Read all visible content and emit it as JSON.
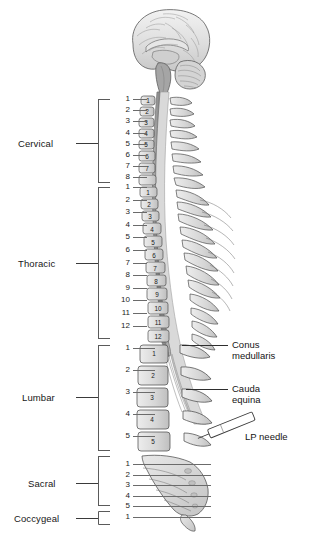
{
  "figure": {
    "background": "#ffffff"
  },
  "colors": {
    "bone_fill": "#dcdcdc",
    "bone_stroke": "#4d4d4d",
    "cord_dark": "#8c8c8c",
    "canal_light": "#c9c9c9",
    "brain_fill": "#e2e2e2",
    "brain_stroke": "#5a5a5a",
    "needle_fill": "#ffffff",
    "needle_stroke": "#3a3a3a",
    "text": "#171717",
    "leader_line": "#2e2e2e",
    "bracket_line": "#5a5a5a"
  },
  "regions": [
    {
      "id": "cervical",
      "label": "Cervical",
      "count": 8,
      "numbers": [
        "1",
        "2",
        "3",
        "4",
        "5",
        "6",
        "7",
        "8"
      ]
    },
    {
      "id": "thoracic",
      "label": "Thoracic",
      "count": 12,
      "numbers": [
        "1",
        "2",
        "3",
        "4",
        "5",
        "6",
        "7",
        "8",
        "9",
        "10",
        "11",
        "12"
      ]
    },
    {
      "id": "lumbar",
      "label": "Lumbar",
      "count": 5,
      "numbers": [
        "1",
        "2",
        "3",
        "4",
        "5"
      ]
    },
    {
      "id": "sacral",
      "label": "Sacral",
      "count": 5,
      "numbers": [
        "1",
        "2",
        "3",
        "4",
        "5"
      ]
    },
    {
      "id": "coccygeal",
      "label": "Coccygeal",
      "count": 1,
      "numbers": [
        "1"
      ]
    }
  ],
  "callouts": [
    {
      "id": "conus-medullaris",
      "label": "Conus\nmedullaris"
    },
    {
      "id": "cauda-equina",
      "label": "Cauda\nequina"
    },
    {
      "id": "lp-needle",
      "label": "LP needle"
    }
  ],
  "vertebra_body_numbers": {
    "cervical": [
      "1",
      "2",
      "3",
      "4",
      "5",
      "6",
      "7"
    ],
    "thoracic": [
      "1",
      "2",
      "3",
      "4",
      "5",
      "6",
      "7",
      "8",
      "9",
      "10",
      "11",
      "12"
    ],
    "lumbar": [
      "1",
      "2",
      "3",
      "4",
      "5"
    ]
  },
  "structures": [
    {
      "id": "brain",
      "name": "brain-midsagittal"
    },
    {
      "id": "brainstem",
      "name": "brainstem"
    },
    {
      "id": "cerebellum",
      "name": "cerebellum"
    },
    {
      "id": "spinal-cord",
      "name": "spinal-cord"
    },
    {
      "id": "vertebral-column",
      "name": "vertebral-column"
    },
    {
      "id": "sacrum",
      "name": "sacrum"
    },
    {
      "id": "coccyx",
      "name": "coccyx"
    },
    {
      "id": "lp-needle",
      "name": "lumbar-puncture-needle"
    }
  ]
}
